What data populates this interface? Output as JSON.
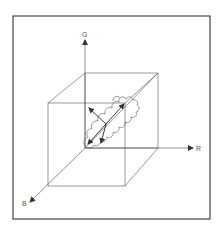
{
  "diagram": {
    "title": "",
    "axes": {
      "g": {
        "label": "G"
      },
      "r": {
        "label": "R"
      },
      "b": {
        "label": "B"
      }
    },
    "colors": {
      "frame": "#444444",
      "lines": "#555555",
      "background": "#ffffff"
    }
  }
}
